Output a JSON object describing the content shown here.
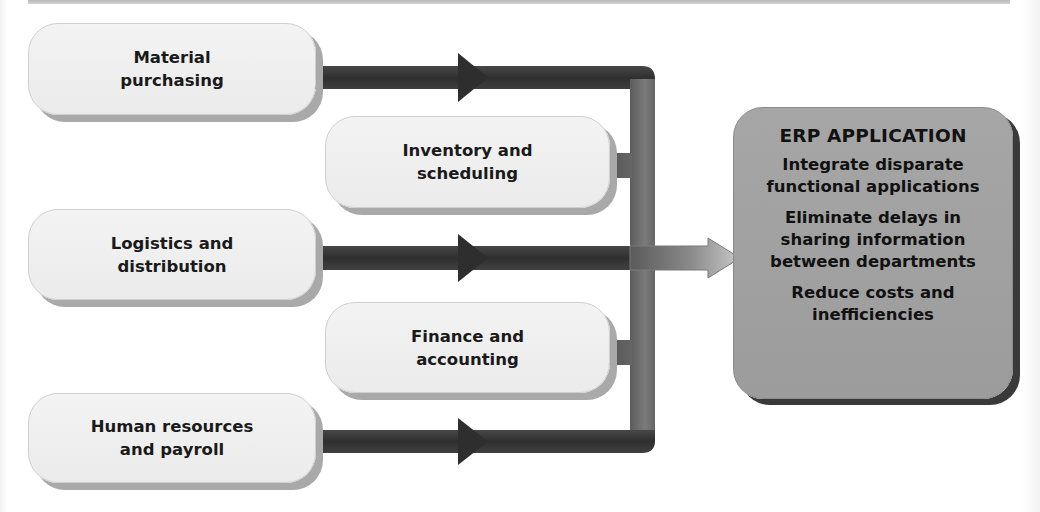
{
  "diagram": {
    "functional_areas": [
      {
        "id": "material",
        "label": "Material\npurchasing"
      },
      {
        "id": "inventory",
        "label": "Inventory and\nscheduling"
      },
      {
        "id": "logistics",
        "label": "Logistics and\ndistribution"
      },
      {
        "id": "finance",
        "label": "Finance and\naccounting"
      },
      {
        "id": "hr",
        "label": "Human resources\nand payroll"
      }
    ],
    "erp": {
      "title": "ERP APPLICATION",
      "points": [
        "Integrate disparate\nfunctional applications",
        "Eliminate delays in\nsharing information\nbetween departments",
        "Reduce costs and\ninefficiencies"
      ]
    },
    "colors": {
      "box_fill": "#efefef",
      "box_shadow": "#a9a9a9",
      "arrow_dark": "#3a3a3a",
      "bus": "#6e6e6e",
      "erp_fill": "#a2a2a2",
      "erp_shadow": "#3a3a3a"
    }
  }
}
